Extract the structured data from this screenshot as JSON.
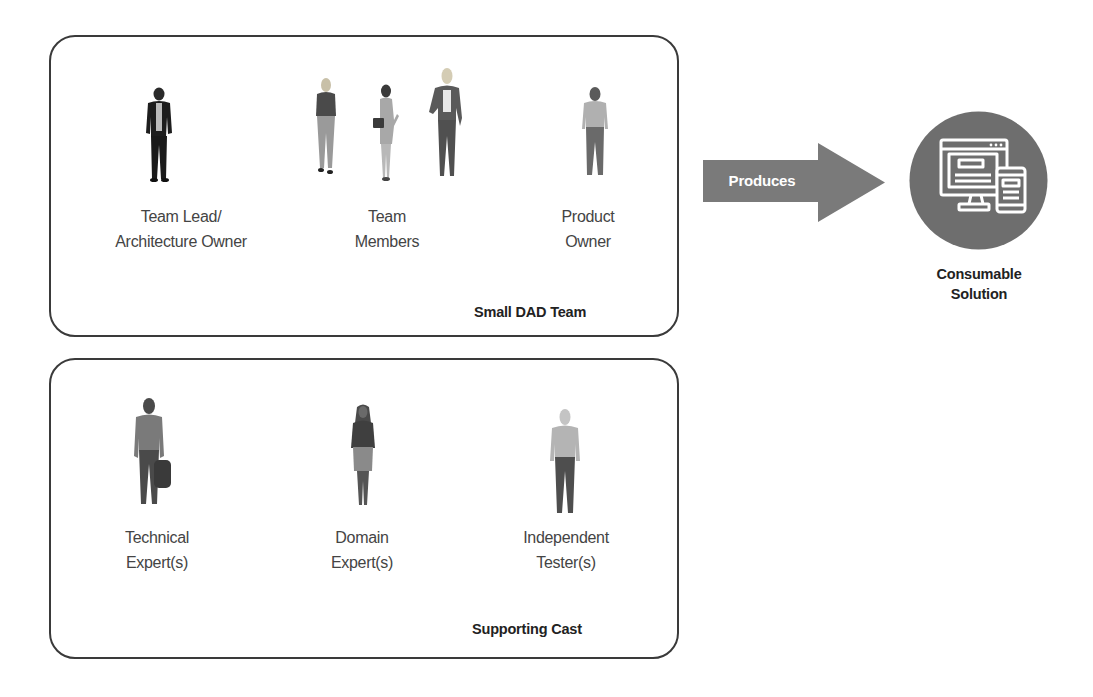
{
  "diagram": {
    "team": {
      "title": "Small DAD Team",
      "roles": [
        {
          "id": "team-lead",
          "lines": [
            "Team Lead/",
            "Architecture Owner"
          ],
          "figure": "person-icon"
        },
        {
          "id": "team-members",
          "lines": [
            "Team",
            "Members"
          ],
          "figure": "people-group-icon"
        },
        {
          "id": "product-owner",
          "lines": [
            "Product",
            "Owner"
          ],
          "figure": "person-icon"
        }
      ]
    },
    "supporting_cast": {
      "title": "Supporting Cast",
      "roles": [
        {
          "id": "technical-expert",
          "lines": [
            "Technical",
            "Expert(s)"
          ],
          "figure": "person-icon"
        },
        {
          "id": "domain-expert",
          "lines": [
            "Domain",
            "Expert(s)"
          ],
          "figure": "person-icon"
        },
        {
          "id": "independent-tester",
          "lines": [
            "Independent",
            "Tester(s)"
          ],
          "figure": "person-icon"
        }
      ]
    },
    "arrow": {
      "label": "Produces",
      "color": "#7a7a7a"
    },
    "output": {
      "lines": [
        "Consumable",
        "Solution"
      ],
      "icon": "devices-icon",
      "circle_color": "#6e6e6e"
    },
    "colors": {
      "box_border": "#3a3a3a",
      "label_text": "#444444",
      "title_text": "#222222"
    }
  }
}
